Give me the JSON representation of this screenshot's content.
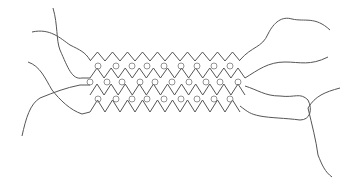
{
  "diagram": {
    "width": 353,
    "height": 187,
    "stroke_color": "#555555",
    "circle_color": "#777777",
    "background": "#ffffff",
    "zigzag_rows": [
      {
        "name": "chain-1",
        "x_start": 90,
        "x_end": 240,
        "peak_y": 52,
        "valley_y": 61,
        "teeth": 10
      },
      {
        "name": "chain-2",
        "x_start": 90,
        "x_end": 245,
        "peak_y": 68,
        "valley_y": 78,
        "teeth": 11
      },
      {
        "name": "chain-3",
        "x_start": 90,
        "x_end": 245,
        "peak_y": 84,
        "valley_y": 95,
        "teeth": 11
      },
      {
        "name": "chain-4",
        "x_start": 90,
        "x_end": 240,
        "peak_y": 100,
        "valley_y": 112,
        "teeth": 10
      }
    ],
    "circle_rows": [
      {
        "name": "crosslinks-1",
        "y": 66,
        "xs": [
          98,
          116,
          132,
          147,
          164,
          181,
          197,
          214,
          230
        ]
      },
      {
        "name": "crosslinks-2",
        "y": 82,
        "xs": [
          90,
          107,
          122,
          140,
          155,
          172,
          189,
          206,
          220,
          238
        ]
      },
      {
        "name": "crosslinks-3",
        "y": 99,
        "xs": [
          98,
          116,
          132,
          147,
          164,
          181,
          197,
          214,
          230
        ]
      }
    ],
    "tails": [
      {
        "name": "tail-left-1",
        "d": "M53,8 C58,25 56,40 60,50 C68,68 72,80 82,78 L90,78"
      },
      {
        "name": "tail-left-2",
        "d": "M32,32 C50,28 60,38 70,45 C80,50 85,52 90,60"
      },
      {
        "name": "tail-left-3",
        "d": "M28,62 C40,66 45,78 52,90 C60,100 70,110 82,114 L90,112"
      },
      {
        "name": "tail-left-4",
        "d": "M22,136 C26,118 30,104 40,98 C55,92 65,88 80,85 L90,85"
      },
      {
        "name": "tail-right-1",
        "d": "M240,60 C252,46 262,48 268,34 C274,22 282,16 292,19 C305,22 315,16 330,30"
      },
      {
        "name": "tail-right-2",
        "d": "M245,78 C258,70 268,62 285,62 C300,62 310,66 328,57"
      },
      {
        "name": "tail-right-3",
        "d": "M245,86 C258,90 265,96 280,96 C295,98 300,92 308,100 C313,110 310,120 300,120 C285,118 270,118 260,116 C250,114 248,112 240,106"
      },
      {
        "name": "tail-right-4",
        "d": "M340,88 C325,92 315,96 308,108 C312,125 316,140 318,155 C322,165 325,172 332,177"
      }
    ]
  }
}
